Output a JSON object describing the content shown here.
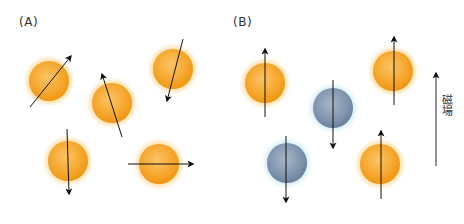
{
  "panels": {
    "a": {
      "label": "(A)",
      "description": "Randomly oriented nuclear spins"
    },
    "b": {
      "label": "(B)",
      "description": "Spins aligned parallel / antiparallel to magnetic field"
    }
  },
  "field": {
    "label": "磁場",
    "direction": "up"
  },
  "colors": {
    "orange_low_energy": "#f5a623",
    "orange_glow": "#fde3b0",
    "blue_high_energy": "#7d93ad",
    "blue_glow": "#d6ecf8",
    "arrow": "#111111"
  },
  "atoms": {
    "a": [
      {
        "cx": 49,
        "cy": 81,
        "color": "orange",
        "arrow": {
          "x1": 30,
          "y1": 107,
          "x2": 71,
          "y2": 56
        }
      },
      {
        "cx": 112,
        "cy": 103,
        "color": "orange",
        "arrow": {
          "x1": 122,
          "y1": 137,
          "x2": 102,
          "y2": 74
        }
      },
      {
        "cx": 173,
        "cy": 69,
        "color": "orange",
        "arrow": {
          "x1": 183,
          "y1": 39,
          "x2": 167,
          "y2": 101
        }
      },
      {
        "cx": 68,
        "cy": 161,
        "color": "orange",
        "arrow": {
          "x1": 67,
          "y1": 129,
          "x2": 69,
          "y2": 194
        }
      },
      {
        "cx": 159,
        "cy": 164,
        "color": "orange",
        "arrow": {
          "x1": 128,
          "y1": 164,
          "x2": 193,
          "y2": 164
        }
      }
    ],
    "b": [
      {
        "cx": 265,
        "cy": 83,
        "color": "orange",
        "arrow": {
          "x1": 265,
          "y1": 117,
          "x2": 265,
          "y2": 49
        }
      },
      {
        "cx": 333,
        "cy": 108,
        "color": "blue",
        "arrow": {
          "x1": 333,
          "y1": 80,
          "x2": 333,
          "y2": 148
        }
      },
      {
        "cx": 393,
        "cy": 71,
        "color": "orange",
        "arrow": {
          "x1": 394,
          "y1": 105,
          "x2": 394,
          "y2": 37
        }
      },
      {
        "cx": 287,
        "cy": 163,
        "color": "blue",
        "arrow": {
          "x1": 286,
          "y1": 136,
          "x2": 286,
          "y2": 202
        }
      },
      {
        "cx": 380,
        "cy": 164,
        "color": "orange",
        "arrow": {
          "x1": 381,
          "y1": 199,
          "x2": 381,
          "y2": 131
        }
      }
    ]
  }
}
